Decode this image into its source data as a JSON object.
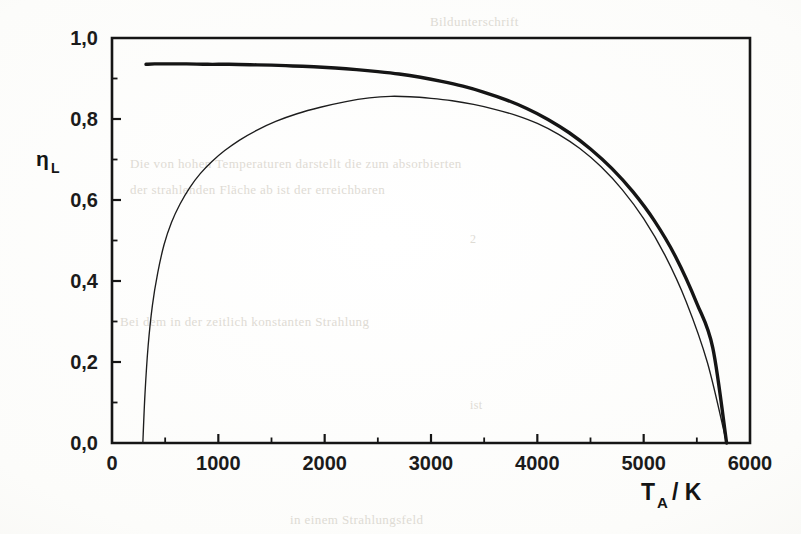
{
  "figure": {
    "background_color": "#fbfbf9",
    "ink_color": "#151515",
    "ghost_text_color": "#dedbd4"
  },
  "ghost_text": [
    {
      "text": "Bildunterschrift",
      "x": 430,
      "y": 14,
      "size": 13
    },
    {
      "text": "Die von  hohen Temperaturen  darstellt  die  zum  absorbierten",
      "x": 130,
      "y": 156,
      "size": 13
    },
    {
      "text": "der  strahlenden  Fläche  ab  ist  der  erreichbaren",
      "x": 130,
      "y": 182,
      "size": 13
    },
    {
      "text": "2",
      "x": 470,
      "y": 232,
      "size": 12
    },
    {
      "text": "Bei dem  in der  zeitlich  konstanten  Strahlung",
      "x": 120,
      "y": 314,
      "size": 13
    },
    {
      "text": "ist",
      "x": 470,
      "y": 398,
      "size": 12
    },
    {
      "text": "in  einem  Strahlungsfeld",
      "x": 290,
      "y": 512,
      "size": 13
    }
  ],
  "chart_data": {
    "type": "line",
    "title": "",
    "xlabel": "T_A / K",
    "ylabel": "eta_L",
    "xlim": [
      0,
      6000
    ],
    "ylim": [
      0.0,
      1.0
    ],
    "grid": false,
    "legend": "none",
    "x_major_tick_interval": 1000,
    "x_minor_tick_interval": 500,
    "y_major_tick_interval": 0.2,
    "y_minor_tick_interval": 0.1,
    "x_tick_labels": [
      "0",
      "1000",
      "2000",
      "3000",
      "4000",
      "5000",
      "6000"
    ],
    "x_tick_values": [
      0,
      1000,
      2000,
      3000,
      4000,
      5000,
      6000
    ],
    "y_tick_labels": [
      "0,0",
      "0,2",
      "0,4",
      "0,6",
      "0,8",
      "1,0"
    ],
    "y_tick_values": [
      0.0,
      0.2,
      0.4,
      0.6,
      0.8,
      1.0
    ],
    "series": [
      {
        "name": "upper-thick-curve",
        "style": "thick",
        "line_width": 3.4,
        "color": "#151515",
        "x": [
          320,
          400,
          500,
          700,
          900,
          1100,
          1300,
          1500,
          1700,
          1900,
          2100,
          2300,
          2500,
          2700,
          2900,
          3100,
          3300,
          3500,
          3700,
          3900,
          4100,
          4300,
          4500,
          4700,
          4900,
          5100,
          5300,
          5500,
          5650,
          5780
        ],
        "y": [
          0.935,
          0.936,
          0.936,
          0.936,
          0.935,
          0.935,
          0.934,
          0.933,
          0.931,
          0.929,
          0.926,
          0.922,
          0.917,
          0.911,
          0.903,
          0.893,
          0.881,
          0.866,
          0.848,
          0.826,
          0.799,
          0.766,
          0.726,
          0.678,
          0.62,
          0.549,
          0.46,
          0.345,
          0.235,
          0.0
        ]
      },
      {
        "name": "lower-thin-curve",
        "style": "thin",
        "line_width": 1.35,
        "color": "#1d1d1d",
        "x": [
          290,
          310,
          340,
          380,
          430,
          490,
          560,
          640,
          730,
          830,
          940,
          1060,
          1200,
          1360,
          1540,
          1740,
          1960,
          2200,
          2420,
          2620,
          2800,
          3000,
          3200,
          3400,
          3600,
          3800,
          4000,
          4200,
          4400,
          4600,
          4800,
          5000,
          5200,
          5400,
          5600,
          5780
        ],
        "y": [
          0.0,
          0.12,
          0.24,
          0.34,
          0.42,
          0.49,
          0.545,
          0.59,
          0.63,
          0.665,
          0.695,
          0.722,
          0.748,
          0.772,
          0.794,
          0.813,
          0.829,
          0.843,
          0.852,
          0.856,
          0.855,
          0.851,
          0.845,
          0.836,
          0.824,
          0.809,
          0.789,
          0.762,
          0.727,
          0.682,
          0.625,
          0.554,
          0.464,
          0.349,
          0.198,
          0.0
        ]
      }
    ],
    "annotations": {
      "thick_curve_plateau_value": 0.935,
      "thin_curve_peak_value": 0.857,
      "thin_curve_peak_x": 2620,
      "thin_curve_onset_x": 290,
      "common_zero_crossing_x": 5780,
      "curves_merge_x": 3700
    }
  },
  "axes": {
    "x_axis_label": "T",
    "x_axis_label_sub": "A",
    "x_axis_label_unit": "/ K",
    "y_axis_label": "η",
    "y_axis_label_sub": "L"
  }
}
